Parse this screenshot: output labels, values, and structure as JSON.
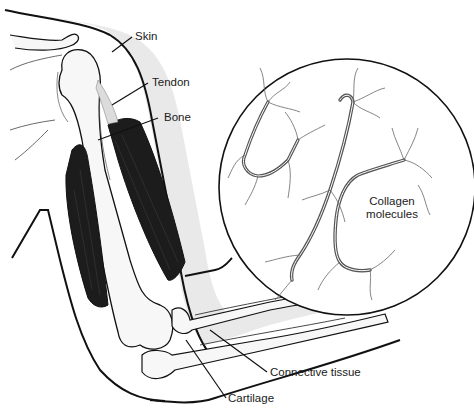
{
  "figure": {
    "labels": {
      "skin": "Skin",
      "tendon": "Tendon",
      "bone": "Bone",
      "collagen_line1": "Collagen",
      "collagen_line2": "molecules",
      "connective_tissue": "Connective tissue",
      "cartilage": "Cartilage"
    },
    "colors": {
      "outline": "#111111",
      "muscle": "#1c1c1c",
      "skin_band": "#e9e9e9",
      "bone_fill": "#f7f7f7",
      "background": "#ffffff",
      "fiber": "#555555"
    }
  }
}
